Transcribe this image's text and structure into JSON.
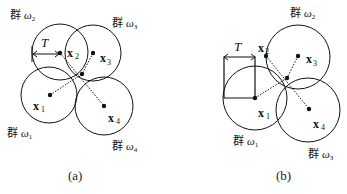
{
  "panels": [
    {
      "id": "a",
      "caption": "(a)",
      "threshold_label": "T",
      "clusters": [
        {
          "name": "群",
          "symbol": "ω",
          "sub": "2"
        },
        {
          "name": "群",
          "symbol": "ω",
          "sub": "3"
        },
        {
          "name": "群",
          "symbol": "ω",
          "sub": "1"
        },
        {
          "name": "群",
          "symbol": "ω",
          "sub": "4"
        }
      ],
      "points": [
        {
          "var": "x",
          "sub": "1"
        },
        {
          "var": "x",
          "sub": "2"
        },
        {
          "var": "x",
          "sub": "3"
        },
        {
          "var": "x",
          "sub": "4"
        }
      ]
    },
    {
      "id": "b",
      "caption": "(b)",
      "threshold_label": "T",
      "clusters": [
        {
          "name": "群",
          "symbol": "ω",
          "sub": "2"
        },
        {
          "name": "群",
          "symbol": "ω",
          "sub": "1"
        },
        {
          "name": "群",
          "symbol": "ω",
          "sub": "3"
        }
      ],
      "points": [
        {
          "var": "x",
          "sub": "1"
        },
        {
          "var": "x",
          "sub": "2"
        },
        {
          "var": "x",
          "sub": "3"
        },
        {
          "var": "x",
          "sub": "4"
        }
      ]
    }
  ],
  "colors": {
    "stroke": "#111111",
    "background": "#ffffff"
  }
}
